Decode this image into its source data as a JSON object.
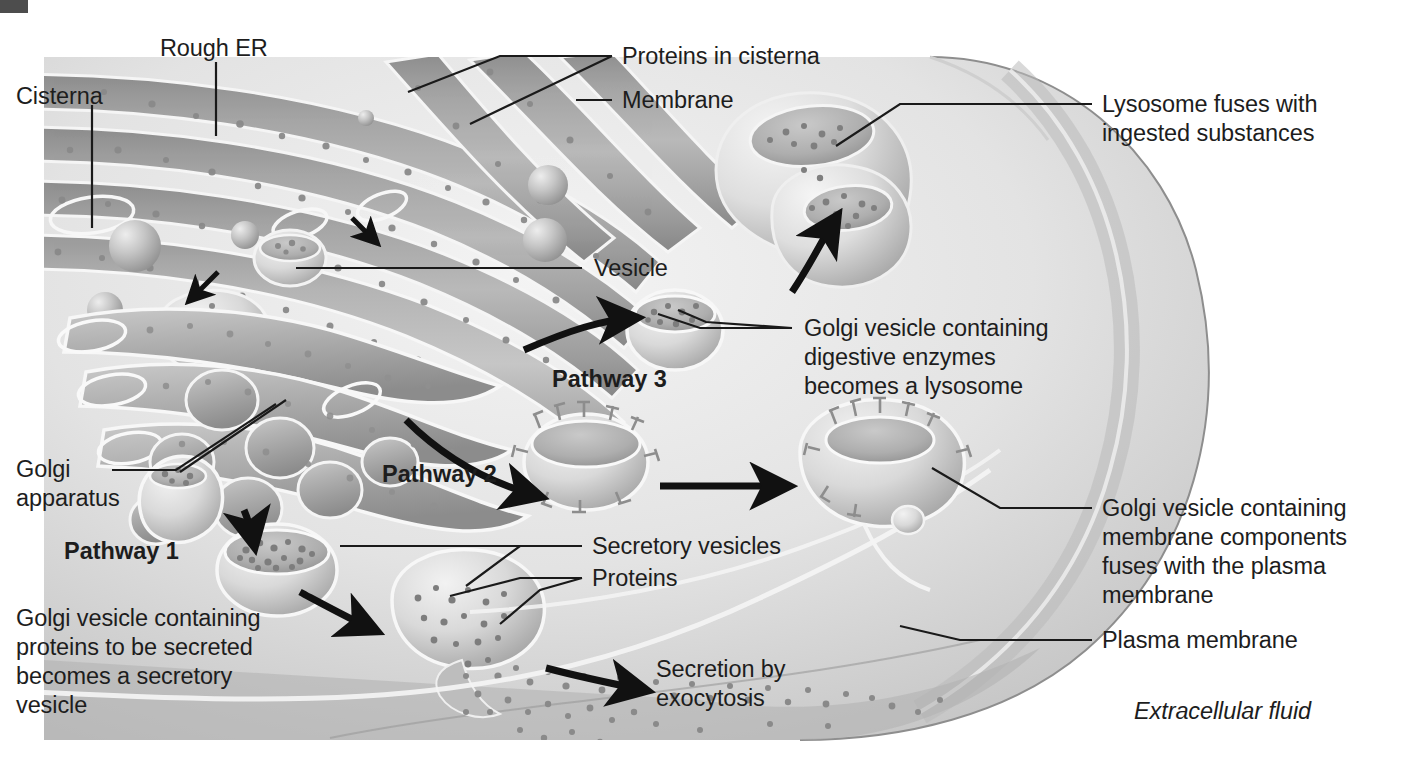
{
  "figure": {
    "style": "grayscale airbrushed biology textbook illustration"
  },
  "colors": {
    "background": "#ffffff",
    "cytoplasm_light": "#e6e6e6",
    "cytoplasm_mid": "#c9c9c9",
    "cytoplasm_dark": "#9a9a9a",
    "er_membrane_dark": "#8f8f8f",
    "er_lumen": "#b5b5b5",
    "highlight_white": "#f7f7f7",
    "label_text": "#1d1d1d",
    "leader_line": "#1a1a1a",
    "corner_mark": "#4d4d4d"
  },
  "labels": {
    "cisterna": "Cisterna",
    "rough_er": "Rough ER",
    "proteins_in_cisterna": "Proteins in cisterna",
    "membrane": "Membrane",
    "lysosome_fuses_line1": "Lysosome fuses with",
    "lysosome_fuses_line2": "ingested substances",
    "vesicle": "Vesicle",
    "golgi_digestive_line1": "Golgi vesicle containing",
    "golgi_digestive_line2": "digestive enzymes",
    "golgi_digestive_line3": "becomes a lysosome",
    "golgi_apparatus_line1": "Golgi",
    "golgi_apparatus_line2": "apparatus",
    "pathway_1": "Pathway 1",
    "pathway_2": "Pathway 2",
    "pathway_3": "Pathway 3",
    "secretory_vesicles": "Secretory vesicles",
    "proteins": "Proteins",
    "golgi_secreted_line1": "Golgi vesicle containing",
    "golgi_secreted_line2": "proteins to be secreted",
    "golgi_secreted_line3": "becomes a secretory",
    "golgi_secreted_line4": "vesicle",
    "secretion_line1": "Secretion by",
    "secretion_line2": "exocytosis",
    "golgi_membrane_line1": "Golgi vesicle containing",
    "golgi_membrane_line2": "membrane components",
    "golgi_membrane_line3": "fuses with the plasma",
    "golgi_membrane_line4": "membrane",
    "plasma_membrane": "Plasma membrane",
    "extracellular_fluid": "Extracellular fluid"
  },
  "structures": [
    {
      "name": "rough-endoplasmic-reticulum",
      "description": "stacked ribbon cisternae studded with ribosomes, upper-left"
    },
    {
      "name": "cisterna",
      "description": "single flattened sac of the rough ER"
    },
    {
      "name": "ribosomes",
      "description": "small dotted granules on ER membrane surface"
    },
    {
      "name": "transport-vesicle",
      "description": "small cup-shaped vesicle budding from ER"
    },
    {
      "name": "golgi-apparatus",
      "description": "stack of curved flattened saccules, mid-left"
    },
    {
      "name": "lysosome",
      "description": "large double-lobed organelle upper-right fused with ingested material"
    },
    {
      "name": "golgi-vesicle-digestive-enzymes",
      "description": "cup vesicle filled with enzyme granules, pathway 3"
    },
    {
      "name": "golgi-vesicle-membrane-components",
      "description": "cup vesicle with T-shaped membrane proteins, pathway 2"
    },
    {
      "name": "golgi-vesicle-secretory",
      "description": "cup vesicle filled with protein granules, pathway 1"
    },
    {
      "name": "secretory-vesicle",
      "description": "vesicle fusing with plasma membrane releasing proteins"
    },
    {
      "name": "plasma-membrane",
      "description": "outer boundary of the cell, curved right edge"
    },
    {
      "name": "secreted-proteins",
      "description": "scatter of granules released outside the cell"
    }
  ],
  "pathways": [
    {
      "id": "pathway_1",
      "label": "Pathway 1",
      "outcome": "Golgi vesicle containing proteins to be secreted becomes a secretory vesicle"
    },
    {
      "id": "pathway_2",
      "label": "Pathway 2",
      "outcome": "Golgi vesicle containing membrane components fuses with the plasma membrane"
    },
    {
      "id": "pathway_3",
      "label": "Pathway 3",
      "outcome": "Golgi vesicle containing digestive enzymes becomes a lysosome"
    }
  ]
}
